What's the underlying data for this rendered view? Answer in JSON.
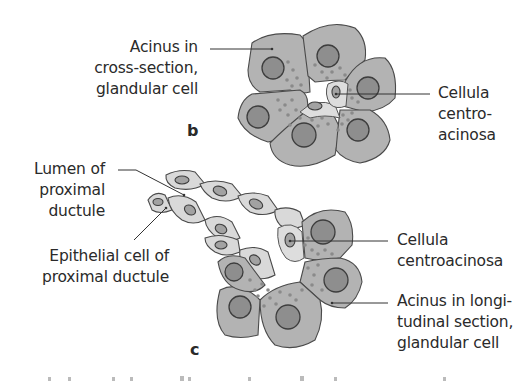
{
  "panels": {
    "b": {
      "letter": "b",
      "labels": {
        "acinus_cross": [
          "Acinus in",
          "cross-section,",
          "glandular cell"
        ],
        "centroacinar": [
          "Cellula",
          "centro-",
          "acinosa"
        ]
      }
    },
    "c": {
      "letter": "c",
      "labels": {
        "lumen": [
          "Lumen of",
          "proximal",
          "ductule"
        ],
        "epithelial": [
          "Epithelial cell of",
          "proximal ductule"
        ],
        "centroacinar": [
          "Cellula",
          "centroacinosa"
        ],
        "acinus_long": [
          "Acinus in longi-",
          "tudinal section,",
          "glandular cell"
        ]
      }
    }
  },
  "colors": {
    "glandular_cell": "#b3b3b3",
    "duct_cell": "#d9d9d9",
    "nucleus": "#8e8e8e",
    "outline": "#4a4a4a",
    "background": "#ffffff"
  }
}
